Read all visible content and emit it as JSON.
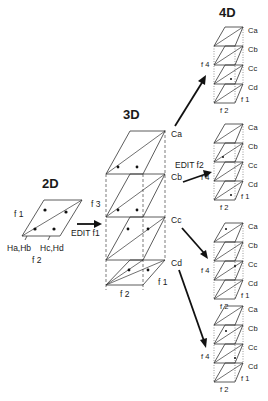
{
  "diagram": {
    "sections": {
      "d2": {
        "title": "2D",
        "axis_left": "f 1",
        "axis_bottom": "f 2",
        "label_left": "Ha,Hb",
        "label_right": "Hc,Hd"
      },
      "d3": {
        "title": "3D",
        "axis_left": "f 3",
        "axis_right": "f 1",
        "axis_bottom": "f 2",
        "layers": [
          "Ca",
          "Cb",
          "Cc",
          "Cd"
        ]
      },
      "d4": {
        "title": "4D",
        "axis_left": "f 4",
        "axis_right": "f 1",
        "axis_bottom": "f 2",
        "layers": [
          "Ca",
          "Cb",
          "Cc",
          "Cd"
        ]
      }
    },
    "edits": {
      "edit_f1": "EDIT f1",
      "edit_f2": "EDIT f2"
    },
    "colors": {
      "ink": "#111111",
      "background": "#ffffff"
    }
  }
}
